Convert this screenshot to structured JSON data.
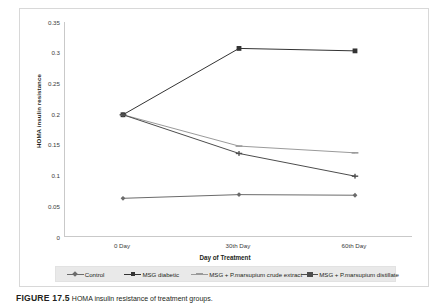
{
  "figure": {
    "caption_number": "FIGURE 17.5",
    "caption_text": "HOMA insulin resistance of treatment groups."
  },
  "chart_data": {
    "type": "line",
    "title": "",
    "xlabel": "Day of Treatment",
    "ylabel": "HOMA insulin resistance",
    "categories": [
      "0 Day",
      "30th Day",
      "60th Day"
    ],
    "ylim": [
      0,
      0.35
    ],
    "ytick_labels": [
      "0.35",
      "0.3",
      "0.25",
      "0.2",
      "0.15",
      "0.1",
      "0.05",
      "0"
    ],
    "ytick_values": [
      0.35,
      0.3,
      0.25,
      0.2,
      0.15,
      0.1,
      0.05,
      0
    ],
    "grid": false,
    "legend_position": "bottom",
    "series": [
      {
        "name": "Control",
        "marker": "diamond",
        "color": "#6b6b6b",
        "values": [
          0.063,
          0.069,
          0.068
        ]
      },
      {
        "name": "MSG diabetic",
        "marker": "square",
        "color": "#333333",
        "values": [
          0.199,
          0.307,
          0.303
        ]
      },
      {
        "name": "MSG + P.marsupium crude extract",
        "marker": "dash",
        "color": "#9a9a9a",
        "values": [
          0.199,
          0.148,
          0.137
        ]
      },
      {
        "name": "MSG + P.marsupium distillate",
        "marker": "star",
        "color": "#4d4d4d",
        "values": [
          0.199,
          0.136,
          0.099
        ]
      }
    ]
  }
}
